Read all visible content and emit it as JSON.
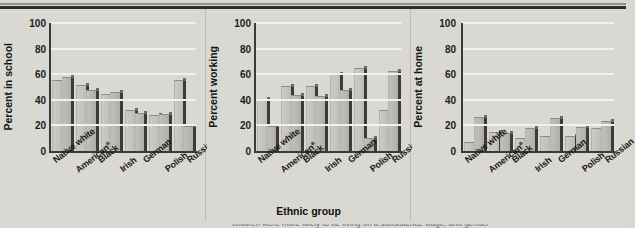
{
  "figure": {
    "background_color": "#d9d8d3",
    "bar_fill_color": "#c0bfba",
    "bar_shadow_color": "#3c3b39",
    "gridline_color": "#f2f1ee",
    "axis_color": "#3a3a38",
    "x_axis_title": "Ethnic group",
    "partial_caption": "children were more likely to be living on a subsistence wage, and gender"
  },
  "chart_data": [
    {
      "type": "bar",
      "title": "",
      "ylabel": "Percent in school",
      "xlabel": "",
      "ylim": [
        0,
        100
      ],
      "yticks": [
        0,
        20,
        40,
        60,
        80,
        100
      ],
      "grid": true,
      "legend": "none",
      "categories": [
        "Native white",
        "Americanᵃ",
        "Black",
        "Irish",
        "German",
        "Polish",
        "Russian"
      ],
      "series": [
        {
          "name": "bar-1",
          "values": [
            55,
            51,
            44,
            31,
            27,
            55,
            null
          ]
        },
        {
          "name": "bar-2",
          "values": [
            57,
            47,
            45,
            29,
            28,
            19,
            null
          ]
        }
      ]
    },
    {
      "type": "bar",
      "title": "",
      "ylabel": "Percent working",
      "xlabel": "Ethnic group",
      "ylim": [
        0,
        100
      ],
      "yticks": [
        0,
        20,
        40,
        60,
        80,
        100
      ],
      "grid": true,
      "legend": "none",
      "categories": [
        "Native white",
        "Americanᵃ",
        "Black",
        "Irish",
        "German",
        "Polish",
        "Russian"
      ],
      "series": [
        {
          "name": "bar-1",
          "values": [
            40,
            50,
            50,
            59,
            64,
            31,
            null
          ]
        },
        {
          "name": "bar-2",
          "values": [
            19,
            43,
            42,
            47,
            9,
            62,
            null
          ]
        }
      ]
    },
    {
      "type": "bar",
      "title": "",
      "ylabel": "Percent at home",
      "xlabel": "",
      "ylim": [
        0,
        100
      ],
      "yticks": [
        0,
        20,
        40,
        60,
        80,
        100
      ],
      "grid": true,
      "legend": "none",
      "categories": [
        "Native white",
        "Americanᵃ",
        "Black",
        "Irish",
        "German",
        "Polish",
        "Russian"
      ],
      "series": [
        {
          "name": "bar-1",
          "values": [
            6,
            14,
            9,
            11,
            11,
            17,
            null
          ]
        },
        {
          "name": "bar-2",
          "values": [
            26,
            13,
            17,
            25,
            18,
            23,
            null
          ]
        }
      ]
    }
  ],
  "panels": [
    {
      "id": "panel-school",
      "ylabel": "Percent in school"
    },
    {
      "id": "panel-working",
      "ylabel": "Percent working"
    },
    {
      "id": "panel-home",
      "ylabel": "Percent at home"
    }
  ]
}
